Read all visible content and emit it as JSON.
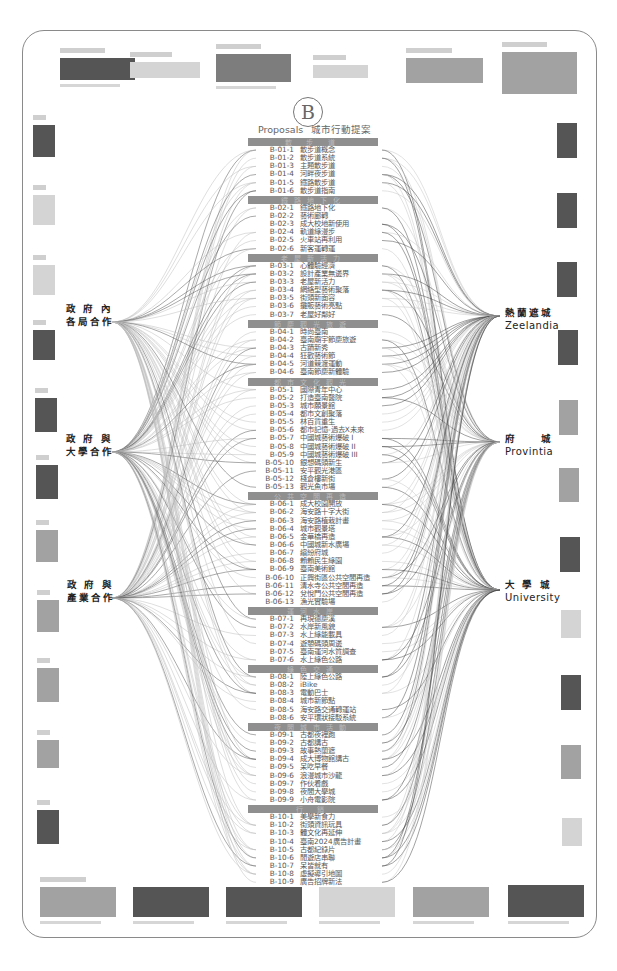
{
  "header": {
    "logo_letter": "B",
    "title_en": "Proposals",
    "title_zh": "城市行動提案"
  },
  "left_groups": [
    {
      "line1": "政 府 內",
      "line2": "各局合作"
    },
    {
      "line1": "政 府 與",
      "line2": "大學合作"
    },
    {
      "line1": "政 府 與",
      "line2": "產業合作"
    }
  ],
  "right_groups": [
    {
      "zh": "熱蘭遮城",
      "en": "Zeelandia"
    },
    {
      "zh": "府　　城",
      "en": "Provintia"
    },
    {
      "zh": "大 學 城",
      "en": "University"
    }
  ],
  "sections": [
    {
      "code": "B-01",
      "header": "散 步 道",
      "items": [
        {
          "code": "B-01-1",
          "name": "散步道概念"
        },
        {
          "code": "B-01-2",
          "name": "散步道系統"
        },
        {
          "code": "B-01-3",
          "name": "主題散步道"
        },
        {
          "code": "B-01-4",
          "name": "河畔夜步道"
        },
        {
          "code": "B-01-5",
          "name": "鐵路散步道"
        },
        {
          "code": "B-01-6",
          "name": "散步道指南"
        }
      ]
    },
    {
      "code": "B-02",
      "header": "鐵路地下化",
      "items": [
        {
          "code": "B-02-1",
          "name": "鐵路地下化"
        },
        {
          "code": "B-02-2",
          "name": "藝術廊轉"
        },
        {
          "code": "B-02-3",
          "name": "成大校地新使用"
        },
        {
          "code": "B-02-4",
          "name": "軌道綠漫步"
        },
        {
          "code": "B-02-5",
          "name": "火車站再利用"
        },
        {
          "code": "B-02-6",
          "name": "新客運轉運"
        }
      ]
    },
    {
      "code": "B-03",
      "header": "老屋新活力",
      "items": [
        {
          "code": "B-03-1",
          "name": "心體驗經濟"
        },
        {
          "code": "B-03-2",
          "name": "設計產業無邊界"
        },
        {
          "code": "B-03-3",
          "name": "老屋新活力"
        },
        {
          "code": "B-03-4",
          "name": "網絡型藝術聚落"
        },
        {
          "code": "B-03-5",
          "name": "街頭新面容"
        },
        {
          "code": "B-03-6",
          "name": "攤販藝術亮點"
        },
        {
          "code": "B-03-7",
          "name": "老屋好鄰好"
        }
      ]
    },
    {
      "code": "B-04",
      "header": "節慶觀光旅遊",
      "items": [
        {
          "code": "B-04-1",
          "name": "時尚臺南"
        },
        {
          "code": "B-04-2",
          "name": "臺南廟宇節慶旅遊"
        },
        {
          "code": "B-04-3",
          "name": "古蹟新秀"
        },
        {
          "code": "B-04-4",
          "name": "狂歡藝術節"
        },
        {
          "code": "B-04-5",
          "name": "河道競渡運動"
        },
        {
          "code": "B-04-6",
          "name": "臺南節慶新體驗"
        }
      ]
    },
    {
      "code": "B-05",
      "header": "都市文化觀光",
      "items": [
        {
          "code": "B-05-1",
          "name": "國際青年中心"
        },
        {
          "code": "B-05-2",
          "name": "打造臺南醫院"
        },
        {
          "code": "B-05-3",
          "name": "城市願景館"
        },
        {
          "code": "B-05-4",
          "name": "都市文創聚落"
        },
        {
          "code": "B-05-5",
          "name": "林百貨重生"
        },
        {
          "code": "B-05-6",
          "name": "都市記憶-過去X未來"
        },
        {
          "code": "B-05-7",
          "name": "中國城藝術爆破 I"
        },
        {
          "code": "B-05-8",
          "name": "中國城藝術爆破 II"
        },
        {
          "code": "B-05-9",
          "name": "中國城藝術爆破 III"
        },
        {
          "code": "B-05-10",
          "name": "銀想碼頭新生"
        },
        {
          "code": "B-05-11",
          "name": "安平觀光港區"
        },
        {
          "code": "B-05-12",
          "name": "棧倉樓新街"
        },
        {
          "code": "B-05-13",
          "name": "觀光魚市場"
        }
      ]
    },
    {
      "code": "B-06",
      "header": "公共空間再造",
      "items": [
        {
          "code": "B-06-1",
          "name": "成大校園開放"
        },
        {
          "code": "B-06-2",
          "name": "海安路十字大街"
        },
        {
          "code": "B-06-3",
          "name": "海安路植栽計畫"
        },
        {
          "code": "B-06-4",
          "name": "城市觀景塔"
        },
        {
          "code": "B-06-5",
          "name": "金華橋再造"
        },
        {
          "code": "B-06-6",
          "name": "中國城新水廣場"
        },
        {
          "code": "B-06-7",
          "name": "繽紛府城"
        },
        {
          "code": "B-06-8",
          "name": "賴賴民生綠園"
        },
        {
          "code": "B-06-9",
          "name": "臺南美術館"
        },
        {
          "code": "B-06-10",
          "name": "正興街區公共空間再造"
        },
        {
          "code": "B-06-11",
          "name": "清水寺公共空間再造"
        },
        {
          "code": "B-06-12",
          "name": "兌悅門公共空間再造"
        },
        {
          "code": "B-06-13",
          "name": "漁光實驗場"
        }
      ]
    },
    {
      "code": "B-07",
      "header": "運河水岸",
      "items": [
        {
          "code": "B-07-1",
          "name": "再現德慶溪"
        },
        {
          "code": "B-07-2",
          "name": "水岸新風貌"
        },
        {
          "code": "B-07-3",
          "name": "水上綠能載具"
        },
        {
          "code": "B-07-4",
          "name": "遊憩碼頭周邊"
        },
        {
          "code": "B-07-5",
          "name": "臺南運河水質調查"
        },
        {
          "code": "B-07-6",
          "name": "水上綠色公路"
        }
      ]
    },
    {
      "code": "B-08",
      "header": "綠色交通",
      "items": [
        {
          "code": "B-08-1",
          "name": "陸上綠色公路"
        },
        {
          "code": "B-08-2",
          "name": "iBike"
        },
        {
          "code": "B-08-3",
          "name": "電動巴士"
        },
        {
          "code": "B-08-4",
          "name": "城市新節點"
        },
        {
          "code": "B-08-5",
          "name": "海安路交通轉運站"
        },
        {
          "code": "B-08-6",
          "name": "安平環狀接駁系統"
        }
      ]
    },
    {
      "code": "B-09",
      "header": "夜間城市活動",
      "items": [
        {
          "code": "B-09-1",
          "name": "古都夜裡跑"
        },
        {
          "code": "B-09-2",
          "name": "古都講古"
        },
        {
          "code": "B-09-3",
          "name": "故事熱蘭遮"
        },
        {
          "code": "B-09-4",
          "name": "成大博物館講古"
        },
        {
          "code": "B-09-5",
          "name": "呆吃早餐"
        },
        {
          "code": "B-09-6",
          "name": "浪漫城市沙龍"
        },
        {
          "code": "B-09-7",
          "name": "作伙看戲"
        },
        {
          "code": "B-09-8",
          "name": "夜間大學城"
        },
        {
          "code": "B-09-9",
          "name": "小舟電影院"
        }
      ]
    },
    {
      "code": "B-10",
      "header": "行 銷",
      "items": [
        {
          "code": "B-10-1",
          "name": "美學新食力"
        },
        {
          "code": "B-10-2",
          "name": "街頭資訊玩具"
        },
        {
          "code": "B-10-3",
          "name": "體文化再延伸"
        },
        {
          "code": "B-10-4",
          "name": "臺南2024廣告計畫"
        },
        {
          "code": "B-10-5",
          "name": "古都紀錄片"
        },
        {
          "code": "B-10-6",
          "name": "閒遊店串聯"
        },
        {
          "code": "B-10-7",
          "name": "呆皆就有"
        },
        {
          "code": "B-10-8",
          "name": "虛擬導引地圖"
        },
        {
          "code": "B-10-9",
          "name": "廣告招牌新法"
        }
      ]
    }
  ],
  "thumbnails": {
    "top": 6,
    "bottom": 7,
    "left": 10,
    "right": 10
  }
}
